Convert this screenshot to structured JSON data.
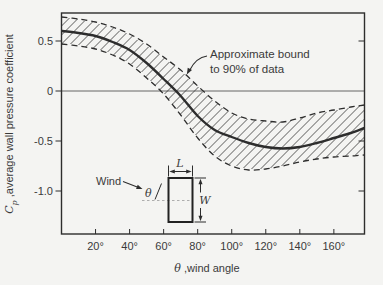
{
  "figure": {
    "background": "#f4f4f2",
    "ink": "#2d2d2d",
    "text_color": "#3a3a3a"
  },
  "axes": {
    "ylabel_var": "C",
    "ylabel_sub": "p",
    "ylabel_rest": " ,average wall pressure coefficient",
    "xlabel_var": "θ",
    "xlabel_rest": " ,wind angle"
  },
  "annotation": {
    "line1": "Approximate bound",
    "line2": "to 90% of data"
  },
  "inset": {
    "wind": "Wind",
    "theta": "θ",
    "length": "L",
    "width": "W"
  },
  "chart_data": {
    "type": "line",
    "title": "",
    "xlabel": "θ, wind angle",
    "ylabel": "Cp, average wall pressure coefficient",
    "xlim": [
      0,
      178
    ],
    "ylim": [
      -1.43,
      0.78
    ],
    "x_ticks": [
      20,
      40,
      60,
      80,
      100,
      120,
      140,
      160
    ],
    "x_tick_labels": [
      "20°",
      "40°",
      "60°",
      "80°",
      "100°",
      "120°",
      "140°",
      "160°"
    ],
    "y_ticks": [
      0.5,
      0,
      -0.5,
      -1.0
    ],
    "y_tick_labels": [
      "0.5",
      "0",
      "-0.5",
      "-1.0"
    ],
    "grid": false,
    "legend": "none",
    "band_fill": "diagonal-hatch",
    "annotation": "Approximate bound to 90% of data",
    "angles_deg": [
      0,
      10,
      20,
      30,
      40,
      50,
      60,
      70,
      80,
      90,
      100,
      110,
      120,
      130,
      140,
      150,
      160,
      170,
      178
    ],
    "series": [
      {
        "name": "mean wall pressure coefficient",
        "style": "solid",
        "values": [
          0.6,
          0.58,
          0.55,
          0.49,
          0.41,
          0.28,
          0.12,
          -0.05,
          -0.25,
          -0.39,
          -0.46,
          -0.52,
          -0.56,
          -0.575,
          -0.56,
          -0.52,
          -0.47,
          -0.42,
          -0.37
        ]
      },
      {
        "name": "upper bound of 90% of data",
        "style": "dashed",
        "values": [
          0.74,
          0.72,
          0.69,
          0.64,
          0.57,
          0.47,
          0.34,
          0.21,
          0.05,
          -0.1,
          -0.22,
          -0.28,
          -0.3,
          -0.31,
          -0.27,
          -0.22,
          -0.19,
          -0.16,
          -0.14
        ]
      },
      {
        "name": "lower bound of 90% of data",
        "style": "dashed",
        "values": [
          0.47,
          0.45,
          0.42,
          0.36,
          0.27,
          0.13,
          -0.03,
          -0.24,
          -0.47,
          -0.65,
          -0.75,
          -0.79,
          -0.78,
          -0.75,
          -0.71,
          -0.68,
          -0.66,
          -0.65,
          -0.64
        ]
      }
    ]
  }
}
